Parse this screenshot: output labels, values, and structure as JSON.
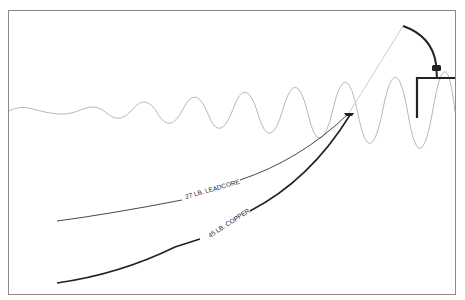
{
  "diagram": {
    "type": "fishing-line-depth-diagram",
    "lines": [
      {
        "label": "27 LB. LEADCORE",
        "color": "#333333",
        "weight": "thin"
      },
      {
        "label": "45 LB. COPPER",
        "color": "#222222",
        "weight": "thick"
      }
    ],
    "elements": [
      "water-surface",
      "boat",
      "fishing-rod",
      "rod-reel",
      "planer-board",
      "tow-line"
    ],
    "colors": {
      "frame": "#8a8a8a",
      "water": "#b0b0b0",
      "tow_line": "#c0c0c0",
      "lines": "#222222"
    }
  },
  "caption": "C... (text cut off at bottom edge)"
}
